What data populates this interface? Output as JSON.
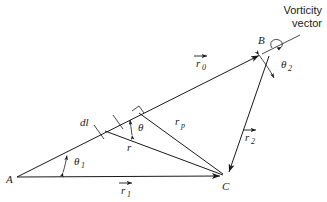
{
  "figure": {
    "title_annotation": {
      "line1": "Vorticity",
      "line2": "vector"
    },
    "vertices": [
      {
        "id": "A",
        "label": "A",
        "x": 17,
        "y": 177
      },
      {
        "id": "B",
        "label": "B",
        "x": 267,
        "y": 51
      },
      {
        "id": "C",
        "label": "C",
        "x": 225,
        "y": 176
      }
    ],
    "vectors": [
      {
        "id": "r0",
        "label": "r",
        "subscript": "0",
        "arrow": true,
        "from": "A",
        "to": "B",
        "label_x": 196,
        "label_y": 66
      },
      {
        "id": "r1",
        "label": "r",
        "subscript": "1",
        "arrow": true,
        "from": "A",
        "to": "C",
        "label_x": 121,
        "label_y": 193
      },
      {
        "id": "r2",
        "label": "r",
        "subscript": "2",
        "arrow": true,
        "from": "B",
        "to": "C",
        "label_x": 245,
        "label_y": 140
      },
      {
        "id": "rp",
        "label": "r",
        "subscript": "p",
        "arrow": false,
        "from": "P",
        "to": "C",
        "label_x": 177,
        "label_y": 126
      },
      {
        "id": "r",
        "label": "r",
        "subscript": "",
        "arrow": false,
        "from": "dl",
        "to": "C",
        "label_x": 129,
        "label_y": 148
      }
    ],
    "angles": [
      {
        "id": "theta1",
        "label": "θ",
        "subscript": "1",
        "at": "A",
        "label_x": 74,
        "label_y": 163
      },
      {
        "id": "theta",
        "label": "θ",
        "subscript": "",
        "at": "dl",
        "label_x": 140,
        "label_y": 130
      },
      {
        "id": "theta2",
        "label": "θ",
        "subscript": "2",
        "at": "B",
        "label_x": 283,
        "label_y": 67
      }
    ],
    "segments": [
      {
        "id": "dl",
        "label": "dl",
        "label_x": 84,
        "label_y": 124
      }
    ],
    "colors": {
      "line": "#1a1a1a",
      "background": "#ffffff",
      "text": "#1a1a1a"
    }
  }
}
